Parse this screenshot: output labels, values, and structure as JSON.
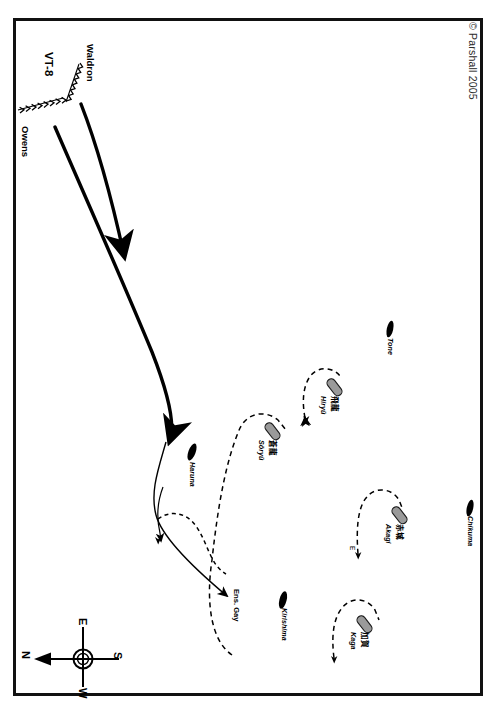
{
  "map": {
    "title": "Torpedo Squadron 8 (VT-8) attack on Kido Butai",
    "copyright": "© Parshall 2005",
    "frame_color": "#111111",
    "background": "#ffffff"
  },
  "compass": {
    "name": "compass-rose",
    "north": "N",
    "east": "E",
    "south": "S",
    "west": "W",
    "note": "north-arrow points left"
  },
  "us_units": [
    {
      "id": "vt8",
      "label": "VT-8",
      "type": "squadron-label",
      "style": "bold"
    },
    {
      "id": "waldron",
      "label": "Waldron",
      "type": "flight-path-label",
      "style": "bold"
    },
    {
      "id": "owens",
      "label": "Owens",
      "type": "flight-path-label",
      "style": "bold"
    },
    {
      "id": "ensgay",
      "label": "Ens. Gay",
      "type": "splash-point-label",
      "style": "bold"
    }
  ],
  "japanese_ships": [
    {
      "id": "soryu",
      "romaji": "Sōryū",
      "kanji": "赤城",
      "kanji_true": "蒼龍",
      "class": "carrier",
      "symbol": "gray"
    },
    {
      "id": "hiryu",
      "romaji": "Hiryū",
      "kanji": "飛龍",
      "kanji_true": "飛龍",
      "class": "carrier",
      "symbol": "gray"
    },
    {
      "id": "akagi",
      "romaji": "Akagi",
      "kanji": "赤城",
      "kanji_true": "赤城",
      "class": "carrier",
      "symbol": "gray"
    },
    {
      "id": "kaga",
      "romaji": "Kaga",
      "kanji": "加賀",
      "kanji_true": "加賀",
      "class": "carrier",
      "symbol": "gray"
    },
    {
      "id": "haruna",
      "romaji": "Haruna",
      "kanji": "",
      "kanji_true": "",
      "class": "battleship",
      "symbol": "black"
    },
    {
      "id": "kirishima",
      "romaji": "Kirishima",
      "kanji": "",
      "kanji_true": "",
      "class": "battleship",
      "symbol": "black"
    },
    {
      "id": "tone",
      "romaji": "Tone",
      "kanji": "",
      "kanji_true": "",
      "class": "cruiser",
      "symbol": "black"
    },
    {
      "id": "chikuma",
      "romaji": "Chikuma",
      "kanji": "",
      "kanji_true": "",
      "class": "cruiser",
      "symbol": "black"
    }
  ],
  "annotations": [
    {
      "id": "akagi-track-marker",
      "label": "E",
      "desc": "track start marker near Akagi"
    }
  ],
  "legend_hints": {
    "solid_arrow": "VT-8 attack track",
    "chevron_line": "approaching flight path",
    "dashed_line": "Japanese ship evasive track"
  }
}
